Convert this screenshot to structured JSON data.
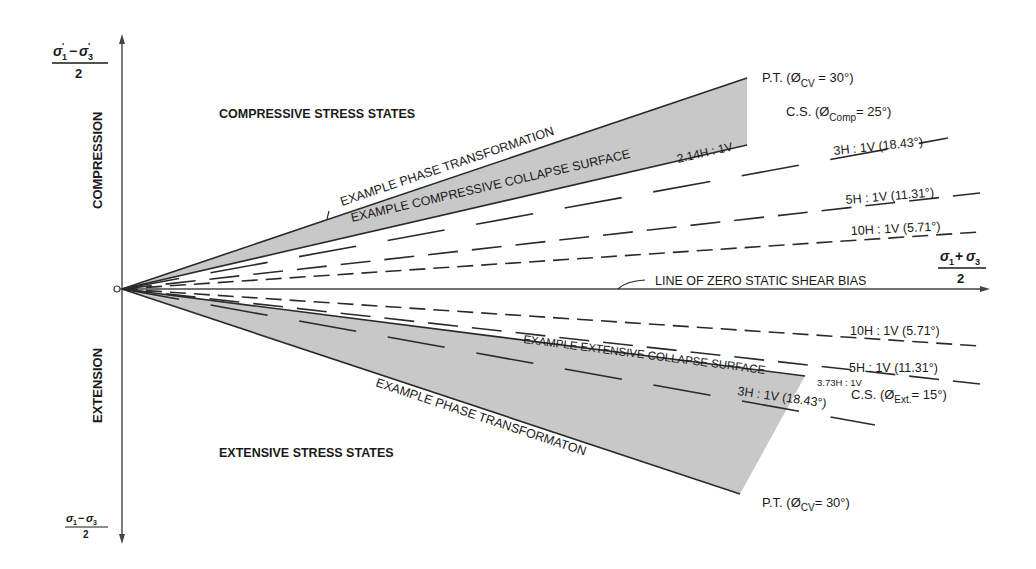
{
  "diagram": {
    "axes": {
      "y_top_label": {
        "numerator": "σ'1−σ'3",
        "num_main_1": "σ",
        "num_sub_1": "1",
        "num_sep": "−",
        "num_main_2": "σ",
        "num_sub_2": "3",
        "denominator": "2"
      },
      "y_bottom_label": {
        "num_main_1": "σ",
        "num_sub_1": "1",
        "num_sep": "−",
        "num_main_2": "σ",
        "num_sub_2": "3",
        "denominator": "2"
      },
      "x_label": {
        "num_main_1": "σ",
        "num_sub_1": "1",
        "num_sep": "+",
        "num_main_2": "σ",
        "num_sub_2": "3",
        "denominator": "2"
      },
      "upper_axis_label": "COMPRESSION",
      "lower_axis_label": "EXTENSION"
    },
    "regions": {
      "compressive": "COMPRESSIVE STRESS STATES",
      "extensive": "EXTENSIVE STRESS STATES"
    },
    "upper_lines": {
      "phase_transformation_label": "EXAMPLE PHASE TRANSFORMATION",
      "collapse_surface_label": "EXAMPLE COMPRESSIVE COLLAPSE SURFACE",
      "collapse_ratio": "2.14H : 1V",
      "pt_annotation": {
        "prefix": "P.T. (Ø",
        "sub": "CV",
        "suffix": " = 30°)"
      },
      "cs_annotation": {
        "prefix": "C.S. (Ø",
        "sub": "Comp",
        "suffix": "= 25°)"
      },
      "slope_3h": "3H : 1V (18.43°)",
      "slope_5h": "5H : 1V (11.31°)",
      "slope_10h": "10H : 1V (5.71°)"
    },
    "zero_line_label": "LINE OF ZERO STATIC SHEAR BIAS",
    "lower_lines": {
      "phase_transformation_label": "EXAMPLE PHASE TRANSFORMATON",
      "collapse_surface_label": "EXAMPLE EXTENSIVE COLLAPSE SURFACE",
      "collapse_ratio": "3.73H : 1V",
      "pt_annotation": {
        "prefix": "P.T. (Ø",
        "sub": "CV",
        "suffix": "= 30°)"
      },
      "cs_annotation": {
        "prefix": "C.S. (Ø",
        "sub": "Ext.",
        "suffix": "= 15°)"
      },
      "slope_3h": "3H : 1V (18.43°)",
      "slope_5h": "5H : 1V (11.31°)",
      "slope_10h": "10H : 1V (5.71°)"
    },
    "colors": {
      "line": "#2a2a2a",
      "shade": "#c8c8c8",
      "text": "#1a1a1a"
    }
  }
}
